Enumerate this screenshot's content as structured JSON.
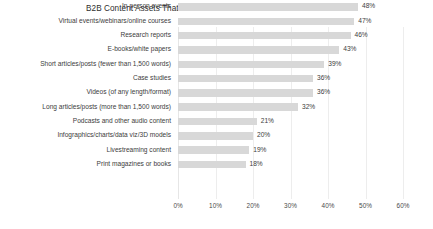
{
  "chart": {
    "title": "B2B Content Assets That Produced the Best Results in Last 12 Months",
    "value_suffix": "%"
  },
  "chart_data": {
    "type": "bar",
    "orientation": "horizontal",
    "title": "B2B Content Assets That Produced the Best Results in Last 12 Months",
    "xlabel": "",
    "ylabel": "",
    "xlim": [
      0,
      60
    ],
    "grid": true,
    "legend": false,
    "bar_color": "#d8d8d8",
    "x_ticks": [
      "0%",
      "10%",
      "20%",
      "30%",
      "40%",
      "50%",
      "60%"
    ],
    "x_tick_values": [
      0,
      10,
      20,
      30,
      40,
      50,
      60
    ],
    "categories": [
      "In-person events",
      "Virtual events/webinars/online courses",
      "Research reports",
      "E-books/white papers",
      "Short articles/posts (fewer than 1,500 words)",
      "Case studies",
      "Videos (of any length/format)",
      "Long articles/posts (more than 1,500 words)",
      "Podcasts and other audio content",
      "Infographics/charts/data viz/3D models",
      "Livestreaming content",
      "Print magazines or books"
    ],
    "values": [
      48,
      47,
      46,
      43,
      39,
      36,
      36,
      32,
      21,
      20,
      19,
      18
    ],
    "data_labels": [
      "48%",
      "47%",
      "46%",
      "43%",
      "39%",
      "36%",
      "36%",
      "32%",
      "21%",
      "20%",
      "19%",
      "18%"
    ]
  }
}
